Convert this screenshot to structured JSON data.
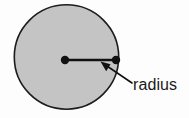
{
  "figure": {
    "background_color": "#fdfdfd",
    "width": 189,
    "height": 118
  },
  "shape": {
    "name": "circle",
    "fill_color": "#c4c4c4",
    "stroke_color": "#1c1c1c",
    "stroke_width": 1.6,
    "center_x": 66.5,
    "center_y": 57,
    "radius": 53
  },
  "markers": {
    "center_point": {
      "label": "center-point",
      "x": 65,
      "y": 60,
      "radius": 4.2,
      "color": "#111111"
    },
    "edge_point": {
      "label": "edge-point",
      "x": 116,
      "y": 60,
      "radius": 4.2,
      "color": "#111111"
    }
  },
  "radius_line": {
    "label": "radius-segment",
    "x1": 65,
    "y1": 60,
    "x2": 116,
    "y2": 60,
    "color": "#111111",
    "width": 2.4
  },
  "annotation": {
    "label_text": "radius",
    "text_x": 133,
    "text_y": 90,
    "text_color": "#1a1a1a",
    "font_size": 16,
    "leader_line": {
      "tail_x": 132,
      "tail_y": 83,
      "tip_x": 101,
      "tip_y": 62,
      "color": "#111111",
      "width": 1.6
    },
    "arrow_head": {
      "points": "101,62 110,64 107,71"
    }
  }
}
